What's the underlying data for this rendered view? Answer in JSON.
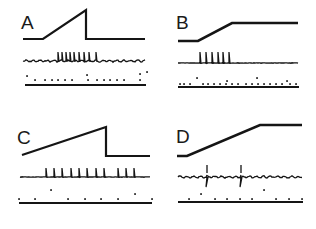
{
  "figure": {
    "width": 316,
    "height": 229,
    "ink_color": "#151515",
    "background": "#ffffff"
  },
  "panels": [
    {
      "label": "A",
      "label_pos": [
        21,
        13
      ],
      "stimulus": {
        "points": [
          [
            23,
            39
          ],
          [
            43,
            39
          ],
          [
            86,
            10
          ],
          [
            86,
            39
          ],
          [
            145,
            39
          ]
        ],
        "width": 2.2
      },
      "response": {
        "baseline_y": 61,
        "x_start": 23,
        "x_end": 145,
        "noisy": true,
        "spikes": [
          58,
          62,
          66,
          70,
          74,
          79,
          84,
          89,
          96
        ],
        "spike_height": 9,
        "spike_dir": "up"
      },
      "markers": {
        "dots_y": 80,
        "dots": [
          35,
          45,
          52,
          58,
          65,
          72,
          88,
          97,
          104,
          110,
          117,
          124,
          140
        ],
        "raised_dots": [
          [
            27,
            76
          ],
          [
            87,
            75
          ],
          [
            140,
            74
          ],
          [
            147,
            72
          ]
        ],
        "baseline_y": 85,
        "x_start": 25,
        "x_end": 146
      }
    },
    {
      "label": "B",
      "label_pos": [
        176,
        13
      ],
      "stimulus": {
        "points": [
          [
            178,
            41
          ],
          [
            198,
            41
          ],
          [
            232,
            23
          ],
          [
            298,
            23
          ]
        ],
        "width": 2.6
      },
      "response": {
        "baseline_y": 63,
        "x_start": 178,
        "x_end": 298,
        "noisy": false,
        "spikes": [
          200,
          206,
          212,
          218,
          223,
          229
        ],
        "spike_height": 11,
        "spike_dir": "up"
      },
      "markers": {
        "dots_y": 84,
        "dots": [
          180,
          184,
          190,
          203,
          208,
          214,
          220,
          226,
          232,
          238,
          246,
          252,
          258,
          264,
          270,
          276,
          282,
          290,
          296
        ],
        "raised_dots": [
          [
            197,
            78
          ],
          [
            227,
            81
          ],
          [
            257,
            78
          ],
          [
            287,
            81
          ]
        ],
        "baseline_y": 87,
        "x_start": 178,
        "x_end": 299
      }
    },
    {
      "label": "C",
      "label_pos": [
        17,
        128
      ],
      "stimulus": {
        "points": [
          [
            22,
            155
          ],
          [
            106,
            127
          ],
          [
            106,
            156
          ],
          [
            150,
            156
          ]
        ],
        "width": 2.2
      },
      "response": {
        "baseline_y": 177,
        "x_start": 20,
        "x_end": 150,
        "noisy": false,
        "spikes": [
          46,
          54,
          62,
          71,
          79,
          87,
          96,
          104,
          118,
          126,
          134
        ],
        "spike_height": 9,
        "spike_dir": "up"
      },
      "markers": {
        "dots_y": 199,
        "dots": [
          19,
          35,
          68,
          85,
          101,
          118,
          152
        ],
        "raised_dots": [
          [
            51,
            190
          ],
          [
            135,
            194
          ]
        ],
        "baseline_y": 203,
        "x_start": 19,
        "x_end": 152
      }
    },
    {
      "label": "D",
      "label_pos": [
        176,
        127
      ],
      "stimulus": {
        "points": [
          [
            177,
            156
          ],
          [
            187,
            156
          ],
          [
            260,
            125
          ],
          [
            302,
            125
          ]
        ],
        "width": 2.6
      },
      "response": {
        "baseline_y": 177,
        "x_start": 178,
        "x_end": 302,
        "noisy": true,
        "spikes": [
          207,
          241
        ],
        "spike_height": 12,
        "spike_dir": "biphasic"
      },
      "markers": {
        "dots_y": 199,
        "dots": [
          189,
          215,
          227,
          240,
          252,
          276,
          289,
          302
        ],
        "raised_dots": [
          [
            201,
            194
          ],
          [
            264,
            190
          ]
        ],
        "baseline_y": 202,
        "x_start": 178,
        "x_end": 303
      }
    }
  ]
}
